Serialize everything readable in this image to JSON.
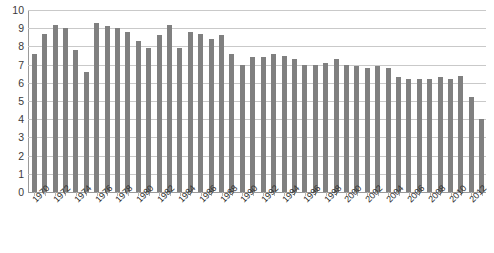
{
  "chart_data": {
    "type": "bar",
    "title": "",
    "subtitle": "",
    "xlabel": "",
    "ylabel": "",
    "ylim": [
      0,
      10
    ],
    "ytick_values": [
      0,
      1,
      2,
      3,
      4,
      5,
      6,
      7,
      8,
      9,
      10
    ],
    "ytick_labels": [
      "0",
      "1",
      "2",
      "3",
      "4",
      "5",
      "6",
      "7",
      "8",
      "9",
      "10"
    ],
    "grid": true,
    "legend": false,
    "legend_position": "none",
    "bar_color": "#808080",
    "gridline_color": "#c9c9c9",
    "axis_color": "#9a9a9a",
    "xtick_rotation": -45,
    "xtick_step": 2,
    "categories": [
      "1970",
      "1971",
      "1972",
      "1973",
      "1974",
      "1975",
      "1976",
      "1977",
      "1978",
      "1979",
      "1980",
      "1981",
      "1982",
      "1983",
      "1984",
      "1985",
      "1986",
      "1987",
      "1988",
      "1989",
      "1990",
      "1991",
      "1992",
      "1993",
      "1994",
      "1995",
      "1996",
      "1997",
      "1998",
      "1999",
      "2000",
      "2001",
      "2002",
      "2003",
      "2004",
      "2005",
      "2006",
      "2007",
      "2008",
      "2009",
      "2010",
      "2011",
      "2012",
      "2013"
    ],
    "xtick_labels": [
      "1970",
      "1972",
      "1974",
      "1976",
      "1978",
      "1980",
      "1982",
      "1984",
      "1986",
      "1988",
      "1990",
      "1992",
      "1994",
      "1996",
      "1998",
      "2000",
      "2002",
      "2004",
      "2006",
      "2008",
      "2010",
      "2012"
    ],
    "values": [
      7.6,
      8.7,
      9.2,
      9.0,
      7.8,
      6.6,
      9.3,
      9.1,
      9.0,
      8.8,
      8.3,
      7.9,
      8.6,
      9.2,
      7.9,
      8.8,
      8.7,
      8.4,
      8.6,
      7.6,
      7.0,
      7.4,
      7.4,
      7.6,
      7.5,
      7.3,
      7.0,
      7.0,
      7.1,
      7.3,
      7.0,
      6.9,
      6.8,
      6.9,
      6.8,
      6.3,
      6.2,
      6.2,
      6.2,
      6.3,
      6.2,
      6.4,
      5.2,
      4.0
    ]
  }
}
